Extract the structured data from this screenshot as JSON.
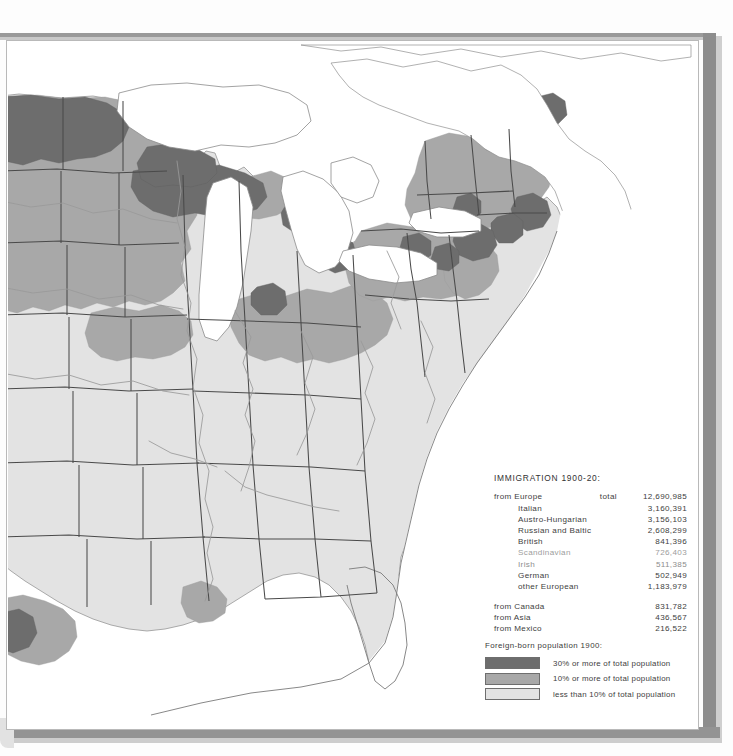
{
  "map": {
    "title": "Foreign-born population and immigration map of the eastern United States",
    "colors": {
      "high": "#6d6d6d",
      "medium": "#a8a8a8",
      "low": "#e3e3e3",
      "water": "#ffffff",
      "outline": "#6f6f6f",
      "state_border": "#4a4a4a",
      "river": "#9a9a9a",
      "paper": "#ffffff",
      "page_edge": "#949494"
    }
  },
  "stats": {
    "title": "IMMIGRATION 1900-20:",
    "total_label": "total",
    "rows": [
      {
        "label": "from Europe",
        "total": "total",
        "value": "12,690,985",
        "level": "top"
      },
      {
        "label": "Italian",
        "total": "",
        "value": "3,160,391",
        "level": "sub"
      },
      {
        "label": "Austro-Hungarian",
        "total": "",
        "value": "3,156,103",
        "level": "sub"
      },
      {
        "label": "Russian and Baltic",
        "total": "",
        "value": "2,608,299",
        "level": "sub"
      },
      {
        "label": "British",
        "total": "",
        "value": "841,396",
        "level": "sub"
      },
      {
        "label": "Scandinavian",
        "total": "",
        "value": "726,403",
        "level": "sub"
      },
      {
        "label": "Irish",
        "total": "",
        "value": "511,385",
        "level": "sub"
      },
      {
        "label": "German",
        "total": "",
        "value": "502,949",
        "level": "sub"
      },
      {
        "label": "other European",
        "total": "",
        "value": "1,183,979",
        "level": "sub"
      },
      {
        "label": "from Canada",
        "total": "",
        "value": "831,782",
        "level": "top"
      },
      {
        "label": "from Asia",
        "total": "",
        "value": "436,567",
        "level": "top"
      },
      {
        "label": "from Mexico",
        "total": "",
        "value": "216,522",
        "level": "top"
      }
    ]
  },
  "legend": {
    "title": "Foreign-born population 1900:",
    "items": [
      {
        "swatch": "high",
        "label": "30% or more of total population"
      },
      {
        "swatch": "medium",
        "label": "10% or more of total population"
      },
      {
        "swatch": "low",
        "label": "less than 10% of total population"
      }
    ]
  }
}
